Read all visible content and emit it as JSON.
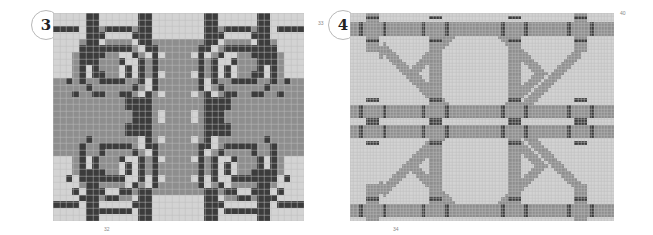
{
  "colors": {
    "background": "#d3d3d3",
    "grid_line": "#bdbdbd",
    "medium": "#8e8e8e",
    "dark": "#3c3c3c",
    "badge_border": "#b8b8b8"
  },
  "patterns": [
    {
      "id": "pattern-3",
      "badge": "3",
      "labels": {
        "bottom": "32",
        "right": "33"
      },
      "grid": {
        "cols": 38,
        "rows": 32
      },
      "description": "Mirrored scroll-spiral motif with central vertical column and horizontal arrow bands"
    },
    {
      "id": "pattern-4",
      "badge": "4",
      "labels": {
        "bottom": "34",
        "top_right": "40"
      },
      "grid": {
        "cols": 80,
        "rows": 63
      },
      "description": "Interlocking rounded-square knot motif with dark tie-marks at crossings"
    }
  ]
}
